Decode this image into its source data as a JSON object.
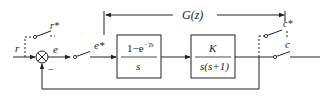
{
  "diagram": {
    "title_label": "G(z)",
    "signals": {
      "input": "r",
      "input_sampled": "r*",
      "error": "e",
      "error_sampled": "e*",
      "output": "c",
      "output_sampled": "c*",
      "feedback_sign": "−"
    },
    "blocks": [
      {
        "id": "zoh",
        "numerator_base": "1−e",
        "numerator_exp": "−Ts",
        "denominator": "s"
      },
      {
        "id": "plant",
        "numerator": "K",
        "denominator": "s(s+1)"
      }
    ],
    "colors": {
      "stroke": "#222222",
      "background": "#ffffff"
    }
  }
}
